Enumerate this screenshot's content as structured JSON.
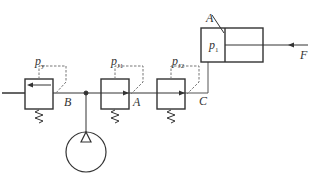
{
  "diagram": {
    "type": "hydraulic-circuit",
    "colors": {
      "line": "#333333",
      "pilot": "#777777",
      "background": "#ffffff"
    },
    "labels": {
      "py_main": "p",
      "py_sub": "y",
      "pj1_main": "p",
      "pj1_sub": "J1",
      "pj2_main": "p",
      "pj2_sub": "J2",
      "p1_main": "p",
      "p1_sub": "1",
      "B": "B",
      "A_mid": "A",
      "C": "C",
      "A_top": "A",
      "F": "F"
    },
    "components": [
      {
        "id": "relief-valve",
        "pilot_label": "py",
        "port_label": "B"
      },
      {
        "id": "reducing-valve-1",
        "pilot_label": "pJ1",
        "port_label": "A"
      },
      {
        "id": "reducing-valve-2",
        "pilot_label": "pJ2",
        "port_label": "C"
      },
      {
        "id": "pump"
      },
      {
        "id": "hydraulic-cylinder",
        "chamber_label": "p1",
        "area_label": "A",
        "load_label": "F"
      }
    ]
  }
}
